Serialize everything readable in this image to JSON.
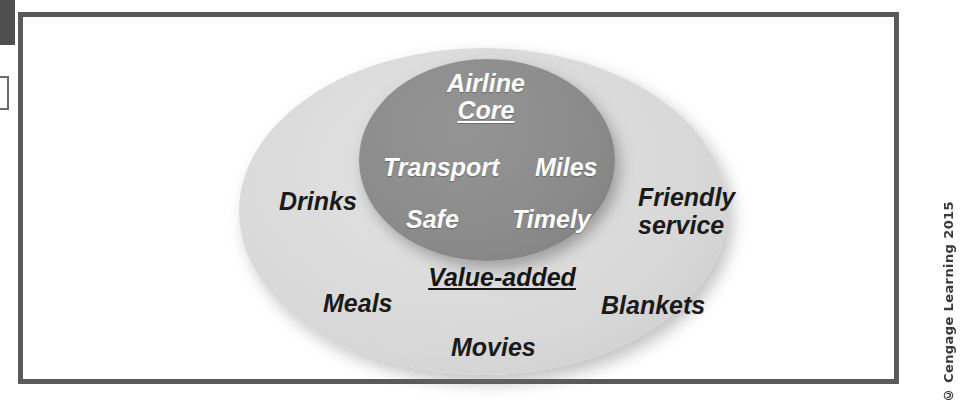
{
  "figure": {
    "type": "concentric-ellipse-diagram",
    "inner_region": {
      "heading_line1": "Airline",
      "heading_line2": "Core",
      "heading_underlined": "Core",
      "fill_color": "#8c8c8c",
      "text_color": "#ffffff",
      "items": [
        {
          "label": "Transport",
          "position": "left"
        },
        {
          "label": "Miles",
          "position": "right"
        },
        {
          "label": "Safe",
          "position": "lower-left"
        },
        {
          "label": "Timely",
          "position": "lower-right"
        }
      ]
    },
    "outer_region": {
      "heading": "Value-added",
      "heading_underlined": true,
      "fill_color": "#d9d9d9",
      "text_color": "#1a1a1a",
      "items": [
        {
          "label": "Drinks",
          "position": "left"
        },
        {
          "label": "Friendly service",
          "line1": "Friendly",
          "line2": "service",
          "position": "right"
        },
        {
          "label": "Meals",
          "position": "lower-left"
        },
        {
          "label": "Blankets",
          "position": "lower-right"
        },
        {
          "label": "Movies",
          "position": "bottom"
        }
      ]
    }
  },
  "credit": {
    "text": "© Cengage Learning 2015"
  },
  "frame": {
    "border_color": "#5a5a5a"
  }
}
